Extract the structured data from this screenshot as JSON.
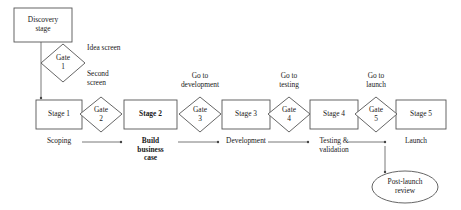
{
  "diagram": {
    "type": "stage-gate-process-flow",
    "colors": {
      "stroke": "#555555",
      "text": "#1a1a1a",
      "background": "#ffffff"
    },
    "discovery": {
      "label": "Discovery\nstage",
      "shape": "rectangle"
    },
    "post_launch": {
      "label": "Post-launch\nreview",
      "shape": "ellipse"
    },
    "gates": [
      {
        "id": "gate-1",
        "label": "Gate\n1",
        "number": "1",
        "caption": "Idea screen"
      },
      {
        "id": "gate-2",
        "label": "Gate\n2",
        "number": "2",
        "caption": "Second\nscreen"
      },
      {
        "id": "gate-3",
        "label": "Gate\n3",
        "number": "3",
        "caption": "Go to\ndevelopment"
      },
      {
        "id": "gate-4",
        "label": "Gate\n4",
        "number": "4",
        "caption": "Go to\ntesting"
      },
      {
        "id": "gate-5",
        "label": "Gate\n5",
        "number": "5",
        "caption": "Go to\nlaunch"
      }
    ],
    "stages": [
      {
        "id": "stage-1",
        "label": "Stage 1",
        "caption": "Scoping",
        "bold": false
      },
      {
        "id": "stage-2",
        "label": "Stage 2",
        "caption": "Build\nbusiness\ncase",
        "bold": true
      },
      {
        "id": "stage-3",
        "label": "Stage 3",
        "caption": "Development",
        "bold": false
      },
      {
        "id": "stage-4",
        "label": "Stage 4",
        "caption": "Testing &\nvalidation",
        "bold": false
      },
      {
        "id": "stage-5",
        "label": "Stage 5",
        "caption": "Launch",
        "bold": false
      }
    ]
  }
}
